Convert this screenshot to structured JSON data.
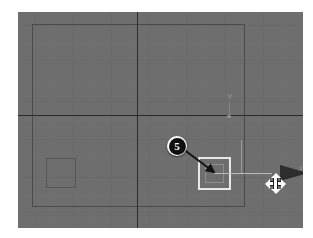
{
  "scene": {
    "app_kind": "3d-viewport",
    "viewport_background": "#6e6e6e",
    "grid_line_color": "#7d7d7d",
    "axis_line_color": "#2b2b2b",
    "selection_color": "#e8e8e8"
  },
  "axis_labels": {
    "y": "Y",
    "x": "X"
  },
  "objects": [
    {
      "name": "unselected-box",
      "label": "",
      "selected": false,
      "outline_color": "#555555"
    },
    {
      "name": "selected-box",
      "label": "",
      "selected": true,
      "outline_color": "#e8e8e8"
    }
  ],
  "gizmo": {
    "type": "move-gizmo",
    "active_axis": "X",
    "axis_x_label": "X",
    "axis_x_color": "#2d2d2d",
    "axis_y_color": "#9d9d9d"
  },
  "cursor": {
    "type": "move-cursor",
    "shape": "four-way-arrow"
  },
  "callouts": [
    {
      "number": "5",
      "points_to": "selected-box",
      "bullet_fill": "#101010",
      "bullet_text_color": "#ffffff"
    }
  ]
}
